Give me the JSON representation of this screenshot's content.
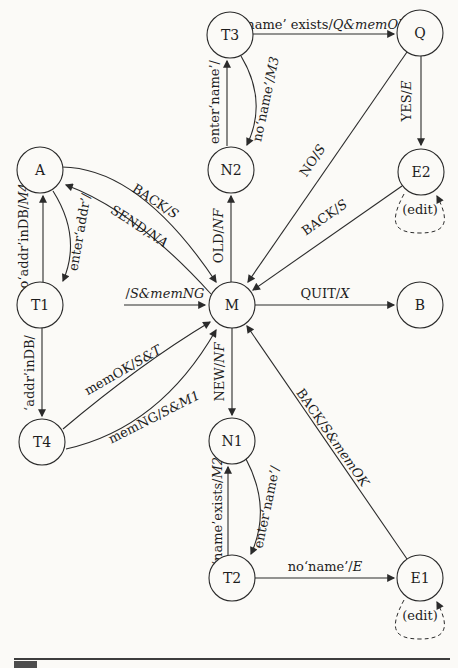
{
  "colors": {
    "ink": "#1d1d1d",
    "line": "#2b2b2b",
    "background": "#fbfaf7",
    "footer_rule": "#3d3d3d",
    "caption_square": "#4d4d4d"
  },
  "diagram": {
    "type": "state-machine",
    "nodes": [
      {
        "id": "T3",
        "label": "T3"
      },
      {
        "id": "Q",
        "label": "Q"
      },
      {
        "id": "N2",
        "label": "N2"
      },
      {
        "id": "E2",
        "label": "E2"
      },
      {
        "id": "A",
        "label": "A"
      },
      {
        "id": "T1",
        "label": "T1"
      },
      {
        "id": "M",
        "label": "M"
      },
      {
        "id": "B",
        "label": "B"
      },
      {
        "id": "T4",
        "label": "T4"
      },
      {
        "id": "N1",
        "label": "N1"
      },
      {
        "id": "T2",
        "label": "T2"
      },
      {
        "id": "E1",
        "label": "E1"
      }
    ],
    "edges": {
      "start_m": {
        "from": "start",
        "to": "M",
        "input": "/",
        "output": "S&memNG"
      },
      "t3_q": {
        "from": "T3",
        "to": "Q",
        "input": "‘name’ exists/",
        "output": "Q&memOK"
      },
      "n2_t3": {
        "from": "N2",
        "to": "T3",
        "input": "enter‘name’/",
        "output": ""
      },
      "t3_n2": {
        "from": "T3",
        "to": "N2",
        "input": "no‘name’/",
        "output": "M3"
      },
      "q_e2": {
        "from": "Q",
        "to": "E2",
        "input": "YES/",
        "output": "E"
      },
      "q_m": {
        "from": "Q",
        "to": "M",
        "input": "NO/",
        "output": "S"
      },
      "e2_m": {
        "from": "E2",
        "to": "M",
        "input": "BACK/",
        "output": "S"
      },
      "e2_e2": {
        "from": "E2",
        "to": "E2",
        "input": "(edit)",
        "output": ""
      },
      "m_b": {
        "from": "M",
        "to": "B",
        "input": "QUIT/",
        "output": "X"
      },
      "a_m": {
        "from": "A",
        "to": "M",
        "input": "BACK/",
        "output": "S"
      },
      "m_a": {
        "from": "M",
        "to": "A",
        "input": "SEND/",
        "output": "NA"
      },
      "t1_a": {
        "from": "T1",
        "to": "A",
        "input": "no‘addr’inDB/",
        "output": "M4"
      },
      "a_t1": {
        "from": "A",
        "to": "T1",
        "input": "enter‘addr’/",
        "output": ""
      },
      "t1_t4": {
        "from": "T1",
        "to": "T4",
        "input": "‘addr’inDB/",
        "output": ""
      },
      "t4_m_ok": {
        "from": "T4",
        "to": "M",
        "input": "memOK/",
        "output": "S&T"
      },
      "t4_m_ng": {
        "from": "T4",
        "to": "M",
        "input": "memNG/",
        "output": "S&M1"
      },
      "m_n2": {
        "from": "M",
        "to": "N2",
        "input": "OLD/",
        "output": "NF"
      },
      "m_n1": {
        "from": "M",
        "to": "N1",
        "input": "NEW/",
        "output": "NF"
      },
      "e1_m": {
        "from": "E1",
        "to": "M",
        "input": "BACK/",
        "output": "S&memOK"
      },
      "t2_n1": {
        "from": "T2",
        "to": "N1",
        "input": "‘name’exists/",
        "output": "M2"
      },
      "n1_t2": {
        "from": "N1",
        "to": "T2",
        "input": "enter‘name’/",
        "output": ""
      },
      "t2_e1": {
        "from": "T2",
        "to": "E1",
        "input": "no‘name’/",
        "output": "E"
      },
      "e1_e1": {
        "from": "E1",
        "to": "E1",
        "input": "(edit)",
        "output": ""
      }
    }
  }
}
